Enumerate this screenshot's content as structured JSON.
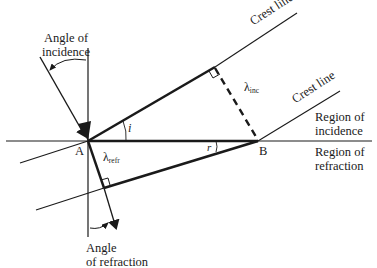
{
  "diagram": {
    "title": "",
    "labels": {
      "angle_of_incidence_line1": "Angle of",
      "angle_of_incidence_line2": "incidence",
      "crest_line_upper": "Crest line",
      "crest_line_lower": "Crest line",
      "lambda_inc_symbol": "λ",
      "lambda_inc_sub": "inc",
      "region_incidence_line1": "Region of",
      "region_incidence_line2": "incidence",
      "region_refraction_line1": "Region of",
      "region_refraction_line2": "refraction",
      "point_a": "A",
      "point_b": "B",
      "angle_i": "i",
      "angle_r": "r",
      "lambda_refr_symbol": "λ",
      "lambda_refr_sub": "refr",
      "angle_of_refraction_line1": "Angle",
      "angle_of_refraction_line2": "of refraction"
    },
    "colors": {
      "stroke": "#1a1a1a",
      "background": "#ffffff"
    }
  }
}
